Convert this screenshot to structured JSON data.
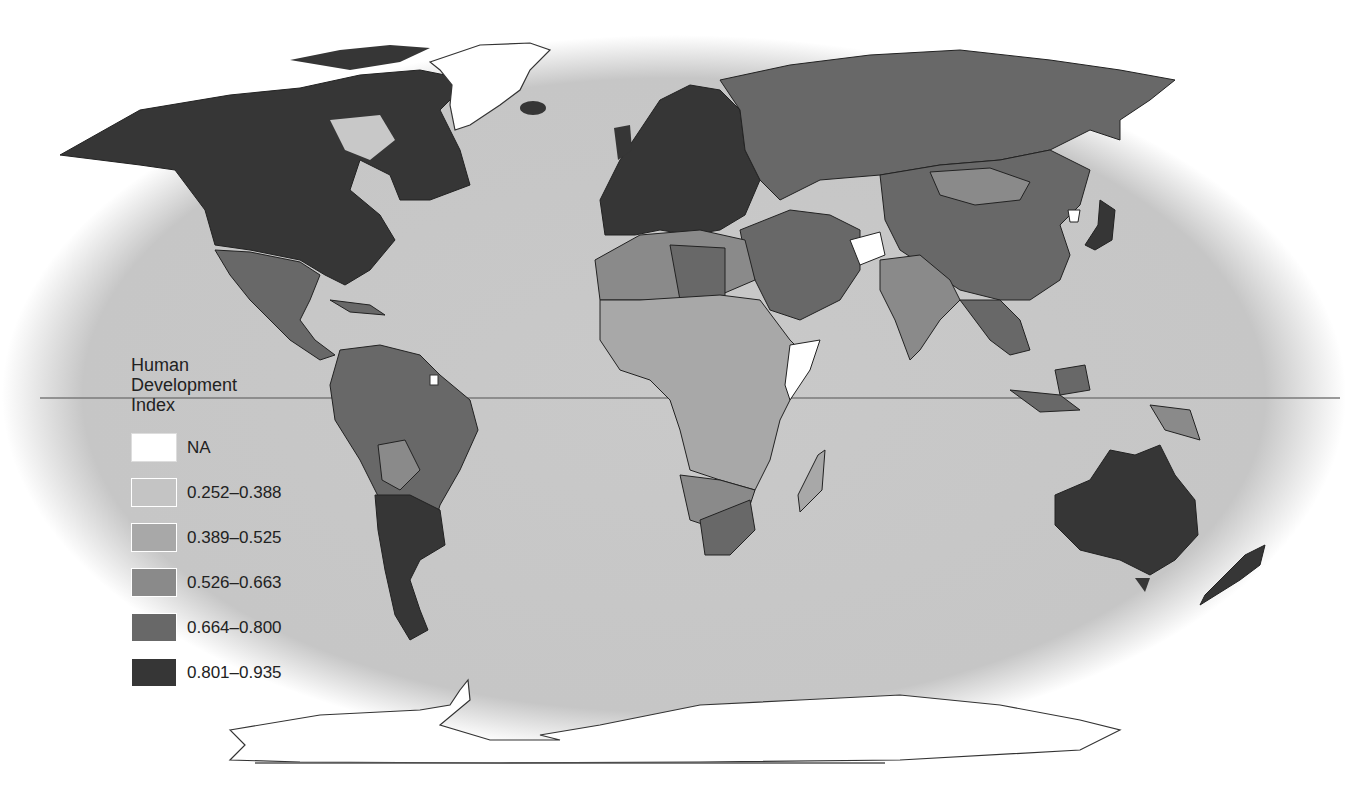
{
  "map": {
    "title": "Human Development Index",
    "projection": "Robinson-like world map",
    "equator_line": true,
    "background_ocean": "#c8c8c8"
  },
  "legend": {
    "title_lines": [
      "Human",
      "Development",
      "Index"
    ],
    "items": [
      {
        "label": "NA",
        "color": "#ffffff"
      },
      {
        "label": "0.252–0.388",
        "color": "#c4c4c4"
      },
      {
        "label": "0.389–0.525",
        "color": "#a8a8a8"
      },
      {
        "label": "0.526–0.663",
        "color": "#8a8a8a"
      },
      {
        "label": "0.664–0.800",
        "color": "#686868"
      },
      {
        "label": "0.801–0.935",
        "color": "#363636"
      }
    ]
  },
  "regions": {
    "north_america": {
      "class": "0.801–0.935"
    },
    "greenland": {
      "class": "NA"
    },
    "mexico_central_america": {
      "class": "0.664–0.800"
    },
    "south_america": {
      "class": "0.664–0.800"
    },
    "argentina_chile": {
      "class": "0.801–0.935"
    },
    "europe_west": {
      "class": "0.801–0.935"
    },
    "russia": {
      "class": "0.664–0.800"
    },
    "china": {
      "class": "0.664–0.800"
    },
    "mongolia": {
      "class": "0.526–0.663"
    },
    "india": {
      "class": "0.526–0.663"
    },
    "afghanistan": {
      "class": "NA"
    },
    "north_africa": {
      "class": "0.526–0.663"
    },
    "sub_saharan_africa": {
      "class": "0.389–0.525"
    },
    "south_africa": {
      "class": "0.664–0.800"
    },
    "somalia": {
      "class": "NA"
    },
    "australia": {
      "class": "0.801–0.935"
    },
    "japan": {
      "class": "0.801–0.935"
    },
    "antarctica": {
      "class": "NA"
    }
  }
}
